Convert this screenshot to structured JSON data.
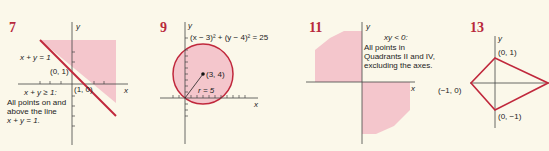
{
  "colors": {
    "shade": "#f4c6cc",
    "line": "#c0283c",
    "axis": "#444444",
    "number": "#b8293b",
    "paper": "#fbf8ea"
  },
  "figures": [
    {
      "number": "7",
      "equation_label": "x + y = 1",
      "point_a": "(0, 1)",
      "point_b": "(1, 0)",
      "inequality": "x + y ≥ 1:",
      "desc_line1": "All points on and",
      "desc_line2": "above the line",
      "desc_line3": "x + y = 1.",
      "x_label": "x",
      "y_label": "y"
    },
    {
      "number": "9",
      "equation": "(x − 3)² + (y − 4)² = 25",
      "center": "(3, 4)",
      "radius": "r = 5",
      "x_label": "x",
      "y_label": "y"
    },
    {
      "number": "11",
      "inequality": "xy < 0:",
      "desc_line1": "All points in",
      "desc_line2": "Quadrants II and IV,",
      "desc_line3": "excluding the axes.",
      "x_label": "x",
      "y_label": "y"
    },
    {
      "number": "13",
      "top": "(0, 1)",
      "left": "(−1, 0)",
      "bottom": "(0, −1)",
      "y_label": "y"
    }
  ]
}
